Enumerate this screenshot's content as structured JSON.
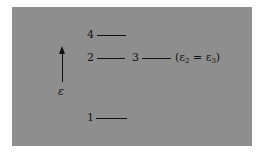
{
  "diagram": {
    "type": "energy-level-diagram",
    "axis": {
      "label": "ε",
      "direction": "up"
    },
    "levels": [
      {
        "id": "1",
        "label": "1"
      },
      {
        "id": "2",
        "label": "2"
      },
      {
        "id": "3",
        "label": "3"
      },
      {
        "id": "4",
        "label": "4"
      }
    ],
    "annotation": {
      "open": "(ε",
      "sub_a": "2",
      "mid": " = ε",
      "sub_b": "3",
      "close": ")"
    },
    "colors": {
      "background": "#8e8e8e",
      "ink": "#111111"
    }
  }
}
